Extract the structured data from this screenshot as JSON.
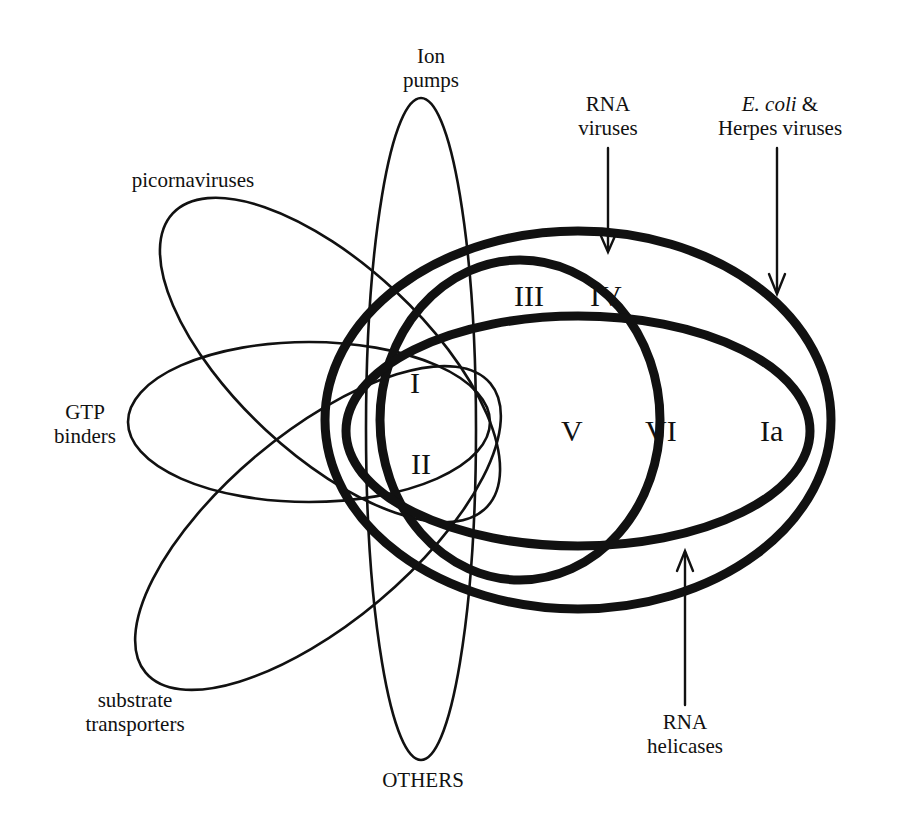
{
  "diagram": {
    "type": "venn",
    "title": "",
    "colors": {
      "stroke": "#111111",
      "background": "#ffffff"
    },
    "sets": [
      {
        "id": "ion-pumps",
        "label_line1": "Ion",
        "label_line2": "pumps",
        "weight": "thin"
      },
      {
        "id": "picornaviruses",
        "label_line1": "picornaviruses",
        "weight": "thin"
      },
      {
        "id": "gtp-binders",
        "label_line1": "GTP",
        "label_line2": "binders",
        "weight": "thin"
      },
      {
        "id": "substrate-transporters",
        "label_line1": "substrate",
        "label_line2": "transporters",
        "weight": "thin"
      },
      {
        "id": "others",
        "label_line1": "OTHERS",
        "weight": "thin"
      },
      {
        "id": "rna-viruses",
        "label_line1": "RNA",
        "label_line2": "viruses",
        "weight": "thick",
        "arrow": "down"
      },
      {
        "id": "ecoli-herpes",
        "label_italic": "E. coli",
        "label_amp": " &",
        "label_line2": "Herpes viruses",
        "weight": "thick",
        "arrow": "down"
      },
      {
        "id": "rna-helicases",
        "label_line1": "RNA",
        "label_line2": "helicases",
        "weight": "thick",
        "arrow": "up"
      }
    ],
    "motifs": [
      "I",
      "Ia",
      "II",
      "III",
      "IV",
      "V",
      "VI"
    ],
    "motif_labels": {
      "I": "I",
      "II": "II",
      "III": "III",
      "IV": "IV",
      "V": "V",
      "VI": "VI",
      "Ia": "Ia"
    }
  }
}
